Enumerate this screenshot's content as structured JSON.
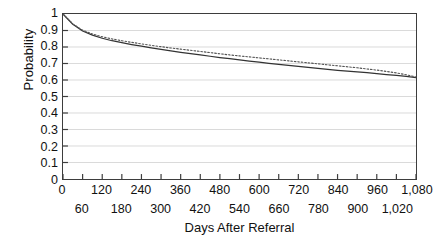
{
  "chart_data": {
    "type": "line",
    "title": "",
    "xlabel": "Days After Referral",
    "ylabel": "Probability",
    "xlim": [
      0,
      1080
    ],
    "ylim": [
      0,
      1
    ],
    "grid": true,
    "legend_position": "none",
    "y_ticks": [
      "1",
      "0.9",
      "0.8",
      "0.7",
      "0.6",
      "0.5",
      "0.4",
      "0.3",
      "0.2",
      "0.1",
      "0"
    ],
    "y_tick_values": [
      1,
      0.9,
      0.8,
      0.7,
      0.6,
      0.5,
      0.4,
      0.3,
      0.2,
      0.1,
      0
    ],
    "x_ticks_upper": [
      "0",
      "120",
      "240",
      "360",
      "480",
      "600",
      "720",
      "840",
      "960",
      "1,080"
    ],
    "x_tick_values_upper": [
      0,
      120,
      240,
      360,
      480,
      600,
      720,
      840,
      960,
      1080
    ],
    "x_ticks_lower": [
      "60",
      "180",
      "300",
      "420",
      "540",
      "660",
      "780",
      "900",
      "1,020"
    ],
    "x_tick_values_lower": [
      60,
      180,
      300,
      420,
      540,
      660,
      780,
      900,
      1020
    ],
    "x_tick_step": 60,
    "x": [
      0,
      30,
      60,
      90,
      120,
      150,
      180,
      210,
      240,
      270,
      300,
      330,
      360,
      390,
      420,
      450,
      480,
      510,
      540,
      570,
      600,
      630,
      660,
      690,
      720,
      750,
      780,
      810,
      840,
      870,
      900,
      930,
      960,
      990,
      1020,
      1050,
      1080
    ],
    "series": [
      {
        "name": "solid-curve",
        "style": "solid",
        "color": "#333333",
        "values": [
          1.0,
          0.938,
          0.897,
          0.872,
          0.853,
          0.838,
          0.826,
          0.815,
          0.805,
          0.795,
          0.786,
          0.777,
          0.768,
          0.76,
          0.752,
          0.744,
          0.736,
          0.729,
          0.722,
          0.715,
          0.708,
          0.701,
          0.695,
          0.688,
          0.682,
          0.676,
          0.67,
          0.665,
          0.659,
          0.654,
          0.649,
          0.644,
          0.639,
          0.633,
          0.628,
          0.622,
          0.615
        ]
      },
      {
        "name": "dotted-curve",
        "style": "dotted",
        "color": "#555555",
        "values": [
          1.0,
          0.94,
          0.902,
          0.879,
          0.862,
          0.849,
          0.838,
          0.828,
          0.819,
          0.81,
          0.802,
          0.794,
          0.787,
          0.78,
          0.773,
          0.766,
          0.759,
          0.752,
          0.746,
          0.74,
          0.734,
          0.728,
          0.722,
          0.716,
          0.71,
          0.704,
          0.698,
          0.692,
          0.686,
          0.68,
          0.674,
          0.667,
          0.66,
          0.652,
          0.643,
          0.632,
          0.618
        ]
      }
    ]
  }
}
